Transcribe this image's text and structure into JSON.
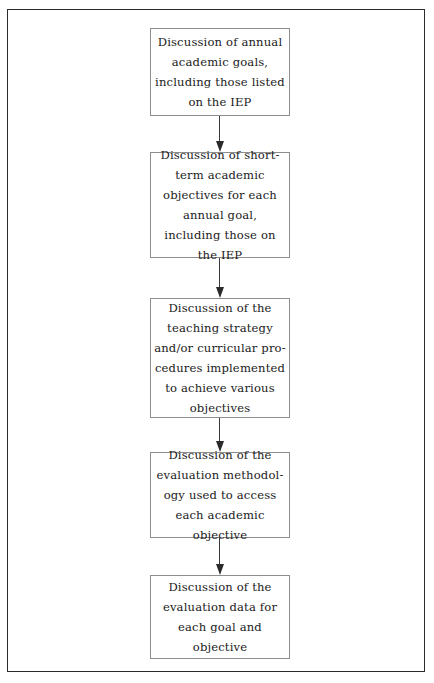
{
  "diagram": {
    "orientation": "vertical-top-to-bottom",
    "border_color": "#2b2b2b",
    "box_border_color": "#8d8d8d",
    "arrow_color": "#2b2b2b",
    "background_color": "#ffffff",
    "text_color": "#1a1a1a",
    "nodes": [
      {
        "id": "node-1",
        "index": 1,
        "text": "Discussion of annual\nacademic goals,\nincluding those listed\non the IEP",
        "lines": [
          "Discussion of annual",
          "academic goals,",
          "including those listed",
          "on the IEP"
        ]
      },
      {
        "id": "node-2",
        "index": 2,
        "text": "Discussion of short-\nterm academic\nobjectives for each\nannual goal,\nincluding those on\nthe IEP",
        "lines": [
          "Discussion of short-",
          "term academic",
          "objectives for each",
          "annual goal,",
          "including those on",
          "the IEP"
        ]
      },
      {
        "id": "node-3",
        "index": 3,
        "text": "Discussion of the\nteaching strategy\nand/or curricular pro-\ncedures implemented\nto achieve various\nobjectives",
        "lines": [
          "Discussion of the",
          "teaching strategy",
          "and/or curricular pro-",
          "cedures implemented",
          "to achieve various",
          "objectives"
        ]
      },
      {
        "id": "node-4",
        "index": 4,
        "text": "Discussion of the\nevaluation methodol-\nogy used to access\neach academic\nobjective",
        "lines": [
          "Discussion of the",
          "evaluation methodol-",
          "ogy used to access",
          "each academic",
          "objective"
        ]
      },
      {
        "id": "node-5",
        "index": 5,
        "text": "Discussion of the\nevaluation data for\neach goal and\nobjective",
        "lines": [
          "Discussion of the",
          "evaluation data for",
          "each goal and",
          "objective"
        ]
      }
    ],
    "connectors": [
      {
        "id": "connector-1",
        "from": "node-1",
        "to": "node-2",
        "style": "arrow-down"
      },
      {
        "id": "connector-2",
        "from": "node-2",
        "to": "node-3",
        "style": "arrow-down"
      },
      {
        "id": "connector-3",
        "from": "node-3",
        "to": "node-4",
        "style": "arrow-down"
      },
      {
        "id": "connector-4",
        "from": "node-4",
        "to": "node-5",
        "style": "arrow-down"
      }
    ]
  }
}
